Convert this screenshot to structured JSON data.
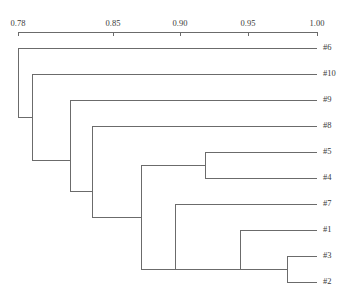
{
  "figure": {
    "type": "dendrogram",
    "orientation": "horizontal-left-to-right",
    "background_color": "#ffffff",
    "line_color": "#6b6b6b",
    "text_color": "#3a3a3a"
  },
  "axis": {
    "position": "top",
    "min": 0.78,
    "max": 1.0,
    "pixel_min": 18,
    "pixel_max": 317,
    "baseline_y": 32,
    "tick_direction": "down",
    "tick_length": 4,
    "ticks": [
      {
        "value": 0.78,
        "label": "0.78",
        "x": 18
      },
      {
        "value": 0.85,
        "label": "0.85",
        "x": 113
      },
      {
        "value": 0.9,
        "label": "0.90",
        "x": 180
      },
      {
        "value": 0.95,
        "label": "0.95",
        "x": 248
      },
      {
        "value": 1.0,
        "label": "1.00",
        "x": 317
      }
    ]
  },
  "chart_data": {
    "type": "dendrogram",
    "title": "",
    "xlabel": "",
    "ylabel": "",
    "xlim": [
      0.78,
      1.0
    ],
    "grid": false,
    "legend": null,
    "leaf_order": [
      "#6",
      "#10",
      "#9",
      "#8",
      "#5",
      "#4",
      "#7",
      "#1",
      "#3",
      "#2"
    ],
    "leaves": [
      {
        "label": "#6",
        "y": 48,
        "leaf_x": 317
      },
      {
        "label": "#10",
        "y": 74,
        "leaf_x": 317
      },
      {
        "label": "#9",
        "y": 100,
        "leaf_x": 317
      },
      {
        "label": "#8",
        "y": 126,
        "leaf_x": 317
      },
      {
        "label": "#5",
        "y": 152,
        "leaf_x": 317
      },
      {
        "label": "#4",
        "y": 178,
        "leaf_x": 317
      },
      {
        "label": "#7",
        "y": 204,
        "leaf_x": 317
      },
      {
        "label": "#1",
        "y": 230,
        "leaf_x": 317
      },
      {
        "label": "#3",
        "y": 256,
        "leaf_x": 317
      },
      {
        "label": "#2",
        "y": 282,
        "leaf_x": 317
      }
    ],
    "merges": [
      {
        "id": "n1",
        "x": 18,
        "value": 0.78,
        "top_y": 48,
        "bottom_y": 117,
        "members": [
          "#6",
          "rest"
        ]
      },
      {
        "id": "n2",
        "x": 32,
        "value": 0.79,
        "top_y": 74,
        "bottom_y": 160,
        "members": [
          "#10",
          "rest"
        ]
      },
      {
        "id": "n3",
        "x": 70,
        "value": 0.818,
        "top_y": 100,
        "bottom_y": 191,
        "members": [
          "#9",
          "rest"
        ]
      },
      {
        "id": "n4",
        "x": 92,
        "value": 0.834,
        "top_y": 126,
        "bottom_y": 217,
        "members": [
          "#8",
          "rest"
        ]
      },
      {
        "id": "n5",
        "x": 205,
        "value": 0.918,
        "top_y": 152,
        "bottom_y": 178,
        "members": [
          "#5",
          "#4"
        ]
      },
      {
        "id": "n6",
        "x": 141,
        "value": 0.87,
        "top_y": 165,
        "bottom_y": 269,
        "members": [
          "(#5,#4)",
          "rest"
        ]
      },
      {
        "id": "n7",
        "x": 175,
        "value": 0.895,
        "top_y": 204,
        "bottom_y": 269,
        "members": [
          "#7",
          "rest"
        ]
      },
      {
        "id": "n8",
        "x": 240,
        "value": 0.943,
        "top_y": 230,
        "bottom_y": 269,
        "members": [
          "#1",
          "(#3,#2)"
        ]
      },
      {
        "id": "n9",
        "x": 287,
        "value": 0.977,
        "top_y": 256,
        "bottom_y": 282,
        "members": [
          "#3",
          "#2"
        ]
      }
    ],
    "segments": [
      {
        "name": "root-stem",
        "x1": 18,
        "y1": 117,
        "x2": 18,
        "y2": 117
      },
      {
        "name": "n1-vertical",
        "x1": 18,
        "y1": 48,
        "x2": 18,
        "y2": 117
      },
      {
        "name": "n1-branch-6",
        "x1": 18,
        "y1": 48,
        "x2": 317,
        "y2": 48
      },
      {
        "name": "n1-branch-rest",
        "x1": 18,
        "y1": 117,
        "x2": 32,
        "y2": 117
      },
      {
        "name": "n2-vertical",
        "x1": 32,
        "y1": 74,
        "x2": 32,
        "y2": 160
      },
      {
        "name": "n2-branch-10",
        "x1": 32,
        "y1": 74,
        "x2": 317,
        "y2": 74
      },
      {
        "name": "n2-branch-rest",
        "x1": 32,
        "y1": 160,
        "x2": 70,
        "y2": 160
      },
      {
        "name": "n3-vertical",
        "x1": 70,
        "y1": 100,
        "x2": 70,
        "y2": 191
      },
      {
        "name": "n3-branch-9",
        "x1": 70,
        "y1": 100,
        "x2": 317,
        "y2": 100
      },
      {
        "name": "n3-branch-rest",
        "x1": 70,
        "y1": 191,
        "x2": 92,
        "y2": 191
      },
      {
        "name": "n4-vertical",
        "x1": 92,
        "y1": 126,
        "x2": 92,
        "y2": 217
      },
      {
        "name": "n4-branch-8",
        "x1": 92,
        "y1": 126,
        "x2": 317,
        "y2": 126
      },
      {
        "name": "n4-branch-rest",
        "x1": 92,
        "y1": 217,
        "x2": 141,
        "y2": 217
      },
      {
        "name": "n6-vertical",
        "x1": 141,
        "y1": 165,
        "x2": 141,
        "y2": 269
      },
      {
        "name": "n6-branch-54",
        "x1": 141,
        "y1": 165,
        "x2": 205,
        "y2": 165
      },
      {
        "name": "n5-vertical",
        "x1": 205,
        "y1": 152,
        "x2": 205,
        "y2": 178
      },
      {
        "name": "n5-branch-5",
        "x1": 205,
        "y1": 152,
        "x2": 317,
        "y2": 152
      },
      {
        "name": "n5-branch-4",
        "x1": 205,
        "y1": 178,
        "x2": 317,
        "y2": 178
      },
      {
        "name": "n6-branch-rest",
        "x1": 141,
        "y1": 269,
        "x2": 175,
        "y2": 269
      },
      {
        "name": "n7-vertical",
        "x1": 175,
        "y1": 204,
        "x2": 175,
        "y2": 269
      },
      {
        "name": "n7-branch-7",
        "x1": 175,
        "y1": 204,
        "x2": 317,
        "y2": 204
      },
      {
        "name": "n7-branch-rest",
        "x1": 175,
        "y1": 269,
        "x2": 240,
        "y2": 269
      },
      {
        "name": "n8-vertical",
        "x1": 240,
        "y1": 230,
        "x2": 240,
        "y2": 269
      },
      {
        "name": "n8-branch-1",
        "x1": 240,
        "y1": 230,
        "x2": 317,
        "y2": 230
      },
      {
        "name": "n8-branch-32",
        "x1": 240,
        "y1": 269,
        "x2": 287,
        "y2": 269
      },
      {
        "name": "n9-vertical",
        "x1": 287,
        "y1": 256,
        "x2": 287,
        "y2": 282
      },
      {
        "name": "n9-branch-3",
        "x1": 287,
        "y1": 256,
        "x2": 317,
        "y2": 256
      },
      {
        "name": "n9-branch-2",
        "x1": 287,
        "y1": 282,
        "x2": 317,
        "y2": 282
      }
    ]
  }
}
